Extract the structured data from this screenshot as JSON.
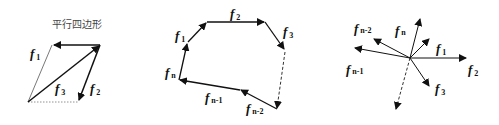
{
  "figure": {
    "panels": [
      {
        "name": "parallelogram",
        "title": "平行四边形",
        "labels": [
          {
            "base": "f",
            "sub": "1"
          },
          {
            "base": "f",
            "sub": "2"
          },
          {
            "base": "f",
            "sub": "3"
          }
        ]
      },
      {
        "name": "force-polygon",
        "labels": [
          {
            "base": "f",
            "sub": "1"
          },
          {
            "base": "f",
            "sub": "2"
          },
          {
            "base": "f",
            "sub": "3"
          },
          {
            "base": "f",
            "sub": "n"
          },
          {
            "base": "f",
            "sub": "n-1"
          },
          {
            "base": "f",
            "sub": "n-2"
          }
        ]
      },
      {
        "name": "concurrent-forces",
        "labels": [
          {
            "base": "f",
            "sub": "n-2"
          },
          {
            "base": "f",
            "sub": "n"
          },
          {
            "base": "f",
            "sub": "1"
          },
          {
            "base": "f",
            "sub": "n-1"
          },
          {
            "base": "f",
            "sub": "2"
          },
          {
            "base": "f",
            "sub": "3"
          }
        ]
      }
    ],
    "colors": {
      "stroke": "#111111",
      "dashed": "#333333",
      "title": "#444444"
    }
  }
}
